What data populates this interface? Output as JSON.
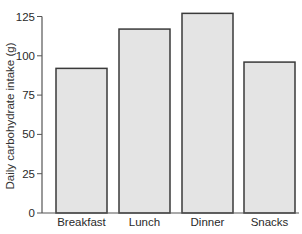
{
  "chart_data": {
    "type": "bar",
    "title": "",
    "xlabel": "",
    "ylabel": "Daily carbohydrate intake (g)",
    "categories": [
      "Breakfast",
      "Lunch",
      "Dinner",
      "Snacks"
    ],
    "values": [
      92,
      117,
      127,
      96
    ],
    "ylim": [
      0,
      125
    ],
    "yticks": [
      0,
      25,
      50,
      75,
      100,
      125
    ],
    "grid": false,
    "legend": null,
    "colors": {
      "bar_fill": "#e4e4e4",
      "bar_edge": "#3a3a3a",
      "axis": "#555555",
      "text": "#2a2a2a"
    }
  }
}
